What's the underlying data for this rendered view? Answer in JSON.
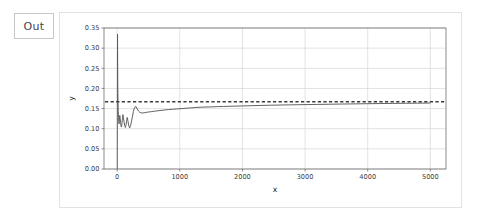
{
  "notebook": {
    "output_prompt_label": "Out"
  },
  "chart_data": {
    "type": "line",
    "title": "",
    "xlabel": "x",
    "ylabel": "y",
    "xlim": [
      -210,
      5250
    ],
    "ylim": [
      0.0,
      0.35
    ],
    "xticks": [
      0,
      1000,
      2000,
      3000,
      4000,
      5000
    ],
    "xtick_labels": [
      "0",
      "1000",
      "2000",
      "3000",
      "4000",
      "5000"
    ],
    "yticks": [
      0.0,
      0.05,
      0.1,
      0.15,
      0.2,
      0.25,
      0.3,
      0.35
    ],
    "ytick_labels": [
      "0.00",
      "0.05",
      "0.10",
      "0.15",
      "0.20",
      "0.25",
      "0.30",
      "0.35"
    ],
    "grid": true,
    "legend": null,
    "series": [
      {
        "name": "running-estimate",
        "style": "solid",
        "color": "#5a5a5a",
        "x": [
          2,
          4,
          6,
          8,
          10,
          14,
          18,
          22,
          26,
          30,
          36,
          42,
          48,
          54,
          60,
          68,
          76,
          84,
          92,
          100,
          110,
          120,
          130,
          140,
          150,
          160,
          170,
          180,
          190,
          200,
          215,
          230,
          245,
          260,
          275,
          290,
          305,
          320,
          340,
          360,
          380,
          400,
          430,
          460,
          500,
          550,
          600,
          650,
          700,
          760,
          820,
          880,
          950,
          1020,
          1100,
          1180,
          1260,
          1340,
          1420,
          1500,
          1600,
          1700,
          1800,
          1900,
          2000,
          2150,
          2300,
          2450,
          2600,
          2750,
          2900,
          3050,
          3200,
          3400,
          3600,
          3800,
          4000,
          4200,
          4400,
          4600,
          4800,
          5000
        ],
        "y": [
          0.0,
          0.19,
          0.335,
          0.262,
          0.205,
          0.168,
          0.143,
          0.128,
          0.118,
          0.112,
          0.122,
          0.133,
          0.126,
          0.116,
          0.108,
          0.104,
          0.112,
          0.125,
          0.135,
          0.127,
          0.117,
          0.108,
          0.103,
          0.108,
          0.118,
          0.128,
          0.121,
          0.112,
          0.105,
          0.102,
          0.108,
          0.119,
          0.131,
          0.143,
          0.151,
          0.155,
          0.154,
          0.149,
          0.144,
          0.141,
          0.1395,
          0.139,
          0.1395,
          0.1405,
          0.1415,
          0.1425,
          0.1435,
          0.1445,
          0.1455,
          0.1465,
          0.1475,
          0.1482,
          0.149,
          0.1498,
          0.1508,
          0.1518,
          0.1528,
          0.1535,
          0.1538,
          0.1542,
          0.1548,
          0.1553,
          0.1557,
          0.1561,
          0.1565,
          0.1572,
          0.1578,
          0.1583,
          0.1588,
          0.1592,
          0.1596,
          0.16,
          0.1603,
          0.1608,
          0.1613,
          0.1617,
          0.1621,
          0.1625,
          0.1628,
          0.1631,
          0.1634,
          0.1637
        ]
      },
      {
        "name": "reference-level",
        "style": "dashed",
        "color": "#3a3a3a",
        "value": 0.1667
      }
    ],
    "colors": {
      "curve": "#5a5a5a",
      "reference": "#3a3a3a",
      "grid": "#d5d5d5",
      "axis": "#6e6e6e"
    }
  }
}
